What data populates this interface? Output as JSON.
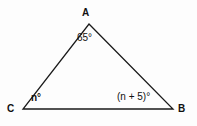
{
  "figure": {
    "type": "triangle-diagram",
    "background_color": "#fdfdfd",
    "stroke_color": "#1a1a1a",
    "text_color": "#111111",
    "vertices": {
      "A": {
        "label": "A",
        "x": 89,
        "y": 24
      },
      "C": {
        "label": "C",
        "x": 23,
        "y": 109
      },
      "B": {
        "label": "B",
        "x": 173,
        "y": 109
      }
    },
    "angles": {
      "at_A": "65°",
      "at_C": "n°",
      "at_B": "(n + 5)°"
    }
  },
  "chart_data": {
    "type": "diagram",
    "title": "",
    "shape": "triangle",
    "vertex_labels": [
      "A",
      "C",
      "B"
    ],
    "vertex_points": [
      [
        89,
        24
      ],
      [
        23,
        109
      ],
      [
        173,
        109
      ]
    ],
    "edges": [
      [
        "A",
        "C"
      ],
      [
        "C",
        "B"
      ],
      [
        "B",
        "A"
      ]
    ],
    "angle_labels": [
      "65°",
      "n°",
      "(n + 5)°"
    ],
    "annotations": [
      "A",
      "65°",
      "C",
      "n°",
      "B",
      "(n + 5)°"
    ]
  }
}
